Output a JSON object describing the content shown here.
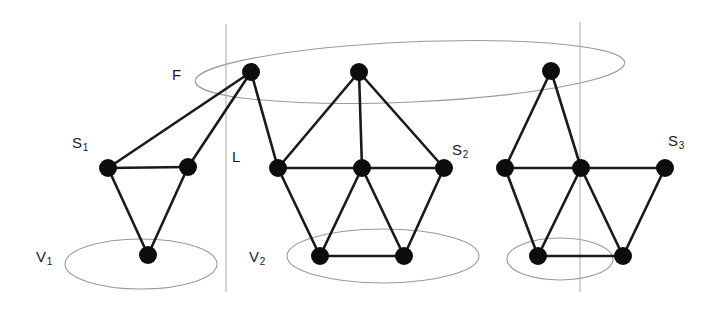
{
  "figure": {
    "background_color": "#ffffff",
    "node_color": "#0d0d0d",
    "edge_color": "#1a1a1a",
    "ellipse_color": "#9a9a9a",
    "partition_line_color": "#b0b0b0"
  },
  "labels": {
    "F": {
      "text": "F",
      "x": 172,
      "y": 66
    },
    "S1": {
      "text": "S",
      "sub": "1",
      "x": 72,
      "y": 134
    },
    "S2": {
      "text": "S",
      "sub": "2",
      "x": 452,
      "y": 141
    },
    "S3": {
      "text": "S",
      "sub": "3",
      "x": 668,
      "y": 132
    },
    "L": {
      "text": "L",
      "x": 232,
      "y": 148
    },
    "V1": {
      "text": "V",
      "sub": "1",
      "x": 36,
      "y": 248
    },
    "V2": {
      "text": "V",
      "sub": "2",
      "x": 249,
      "y": 248
    }
  },
  "ellipses": [
    {
      "name": "F-ellipse",
      "cx": 410,
      "cy": 72,
      "rx": 215,
      "ry": 30,
      "rotation": -2.5
    },
    {
      "name": "V1-ellipse",
      "cx": 141,
      "cy": 264,
      "rx": 76,
      "ry": 25,
      "rotation": 0
    },
    {
      "name": "V2-ellipse",
      "cx": 383,
      "cy": 256,
      "rx": 96,
      "ry": 27,
      "rotation": 0
    },
    {
      "name": "V3-ellipse",
      "cx": 560,
      "cy": 259,
      "rx": 53,
      "ry": 21,
      "rotation": 0
    }
  ],
  "partition_lines": [
    {
      "name": "partition-line-L",
      "x": 226,
      "y1": 24,
      "y2": 292
    },
    {
      "name": "partition-line-right",
      "x": 580,
      "y1": 22,
      "y2": 292
    }
  ],
  "nodes": [
    {
      "id": "f1",
      "x": 251,
      "y": 72,
      "r": 9,
      "group": "F"
    },
    {
      "id": "f2",
      "x": 359,
      "y": 72,
      "r": 9,
      "group": "F"
    },
    {
      "id": "f3",
      "x": 551,
      "y": 71,
      "r": 9,
      "group": "F"
    },
    {
      "id": "a1",
      "x": 108,
      "y": 168,
      "r": 9,
      "group": "S1"
    },
    {
      "id": "a2",
      "x": 188,
      "y": 167,
      "r": 9,
      "group": "S1"
    },
    {
      "id": "a3",
      "x": 148,
      "y": 255,
      "r": 9,
      "group": "V1"
    },
    {
      "id": "b1",
      "x": 278,
      "y": 168,
      "r": 9,
      "group": "S2"
    },
    {
      "id": "b2",
      "x": 362,
      "y": 168,
      "r": 9,
      "group": "S2"
    },
    {
      "id": "b3",
      "x": 444,
      "y": 168,
      "r": 9,
      "group": "S2"
    },
    {
      "id": "b4",
      "x": 320,
      "y": 256,
      "r": 9,
      "group": "V2"
    },
    {
      "id": "b5",
      "x": 404,
      "y": 256,
      "r": 9,
      "group": "V2"
    },
    {
      "id": "c1",
      "x": 505,
      "y": 168,
      "r": 9,
      "group": "S3"
    },
    {
      "id": "c2",
      "x": 581,
      "y": 168,
      "r": 9,
      "group": "S3"
    },
    {
      "id": "c3",
      "x": 665,
      "y": 168,
      "r": 9,
      "group": "S3"
    },
    {
      "id": "c4",
      "x": 538,
      "y": 256,
      "r": 9,
      "group": "V3"
    },
    {
      "id": "c5",
      "x": 623,
      "y": 256,
      "r": 9,
      "group": "V3"
    }
  ],
  "edges": [
    {
      "from": "f1",
      "to": "a1"
    },
    {
      "from": "f1",
      "to": "a2"
    },
    {
      "from": "f1",
      "to": "b1"
    },
    {
      "from": "a1",
      "to": "a2"
    },
    {
      "from": "a1",
      "to": "a3"
    },
    {
      "from": "a2",
      "to": "a3"
    },
    {
      "from": "f2",
      "to": "b1"
    },
    {
      "from": "f2",
      "to": "b2"
    },
    {
      "from": "f2",
      "to": "b3"
    },
    {
      "from": "b1",
      "to": "b2"
    },
    {
      "from": "b2",
      "to": "b3"
    },
    {
      "from": "b1",
      "to": "b4"
    },
    {
      "from": "b2",
      "to": "b4"
    },
    {
      "from": "b2",
      "to": "b5"
    },
    {
      "from": "b3",
      "to": "b5"
    },
    {
      "from": "b4",
      "to": "b5"
    },
    {
      "from": "f3",
      "to": "c1"
    },
    {
      "from": "f3",
      "to": "c2"
    },
    {
      "from": "c1",
      "to": "c2"
    },
    {
      "from": "c2",
      "to": "c3"
    },
    {
      "from": "c1",
      "to": "c4"
    },
    {
      "from": "c2",
      "to": "c4"
    },
    {
      "from": "c2",
      "to": "c5"
    },
    {
      "from": "c3",
      "to": "c5"
    },
    {
      "from": "c4",
      "to": "c5"
    }
  ]
}
